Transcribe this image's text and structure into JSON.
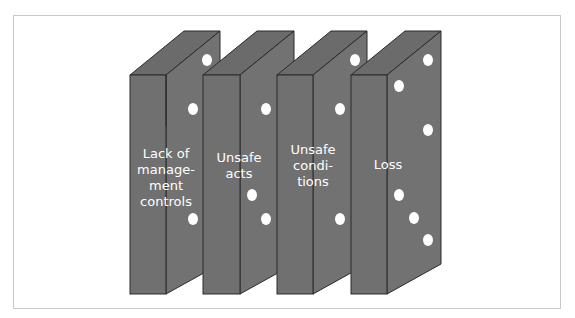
{
  "diagram": {
    "type": "domino-sequence",
    "colors": {
      "domino_fill": "#6f6f6f",
      "domino_edge": "#2a2a2a",
      "pip": "#ffffff",
      "label_text": "#ffffff",
      "frame_border": "#c8c8c8"
    },
    "dominoes": [
      {
        "label": "Lack of manage- ment controls",
        "lines": [
          "Lack of",
          "manage-",
          "ment",
          "controls"
        ]
      },
      {
        "label": "Unsafe acts",
        "lines": [
          "Unsafe",
          "acts"
        ]
      },
      {
        "label": "Unsafe condi- tions",
        "lines": [
          "Unsafe",
          "condi-",
          "tions"
        ]
      },
      {
        "label": "Loss",
        "lines": [
          "Loss"
        ]
      }
    ]
  }
}
